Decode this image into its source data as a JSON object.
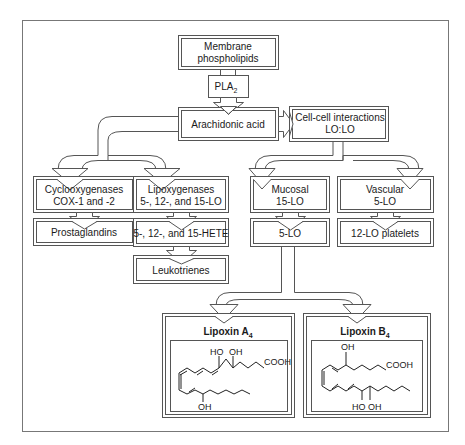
{
  "diagram": {
    "nodes": {
      "membrane": {
        "line1": "Membrane",
        "line2": "phospholipids"
      },
      "pla2": {
        "label": "PLA",
        "sub": "2"
      },
      "arachidonic": {
        "label": "Arachidonic acid"
      },
      "cellcell": {
        "line1": "Cell-cell interactions",
        "line2": "LO:LO"
      },
      "cox": {
        "line1": "Cyclooxygenases",
        "line2": "COX-1 and -2"
      },
      "lipox": {
        "line1": "Lipoxygenases",
        "line2": "5-, 12-, and 15-LO"
      },
      "mucosal": {
        "line1": "Mucosal",
        "line2": "15-LO"
      },
      "vascular": {
        "line1": "Vascular",
        "line2": "5-LO"
      },
      "prostaglandins": {
        "label": "Prostaglandins"
      },
      "hete": {
        "label": "5-, 12-, and 15-HETE"
      },
      "fivelo": {
        "label": "5-LO"
      },
      "twelvelo": {
        "label": "12-LO platelets"
      },
      "leukotrienes": {
        "label": "Leukotrienes"
      },
      "lxa4": {
        "title": "Lipoxin A",
        "sub": "4",
        "ho": "HO",
        "oh1": "OH",
        "cooh": "COOH",
        "oh2": "OH"
      },
      "lxb4": {
        "title": "Lipoxin B",
        "sub": "4",
        "oh1": "OH",
        "cooh": "COOH",
        "ho": "HO",
        "oh2": "OH"
      }
    },
    "colors": {
      "line": "#555555",
      "text": "#1a1a1a",
      "background": "#ffffff"
    }
  }
}
